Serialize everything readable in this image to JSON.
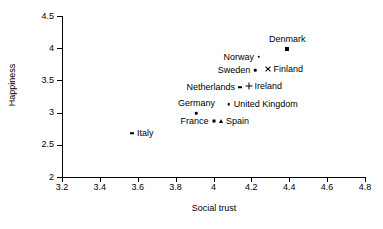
{
  "chart_data": {
    "type": "scatter",
    "title": "",
    "xlabel": "Social trust",
    "ylabel": "Happiness",
    "xlim": [
      3.2,
      4.8
    ],
    "ylim": [
      2,
      4.5
    ],
    "xticks": [
      "3.2",
      "3.4",
      "3.6",
      "3.8",
      "4",
      "4.2",
      "4.4",
      "4.6",
      "4.8"
    ],
    "yticks": [
      "2",
      "2.5",
      "3",
      "3.5",
      "4",
      "4.5"
    ],
    "grid": false,
    "legend": "none",
    "points": [
      {
        "label": "Denmark",
        "x": 4.39,
        "y": 3.99,
        "marker": "square",
        "label_pos": "above"
      },
      {
        "label": "Norway",
        "x": 4.24,
        "y": 3.87,
        "marker": "dot",
        "label_pos": "left"
      },
      {
        "label": "Sweden",
        "x": 4.22,
        "y": 3.66,
        "marker": "dot",
        "label_pos": "left"
      },
      {
        "label": "Finland",
        "x": 4.29,
        "y": 3.68,
        "marker": "cross",
        "label_pos": "right"
      },
      {
        "label": "Netherlands",
        "x": 4.14,
        "y": 3.39,
        "marker": "dash",
        "label_pos": "left"
      },
      {
        "label": "Ireland",
        "x": 4.19,
        "y": 3.41,
        "marker": "plus",
        "label_pos": "right"
      },
      {
        "label": "Germany",
        "x": 3.91,
        "y": 2.99,
        "marker": "dot",
        "label_pos": "above"
      },
      {
        "label": "United Kingdom",
        "x": 4.08,
        "y": 3.13,
        "marker": "dot",
        "label_pos": "right"
      },
      {
        "label": "France",
        "x": 4.0,
        "y": 2.87,
        "marker": "small-square",
        "label_pos": "left"
      },
      {
        "label": "Spain",
        "x": 4.04,
        "y": 2.87,
        "marker": "triangle",
        "label_pos": "right"
      },
      {
        "label": "Italy",
        "x": 3.57,
        "y": 2.68,
        "marker": "dash",
        "label_pos": "right"
      }
    ]
  }
}
